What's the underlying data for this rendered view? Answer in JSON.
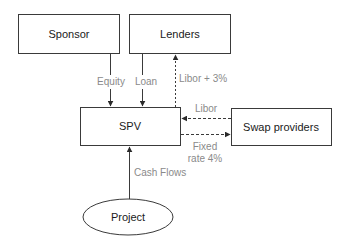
{
  "diagram": {
    "nodes": {
      "sponsor": {
        "label": "Sponsor",
        "shape": "rect"
      },
      "lenders": {
        "label": "Lenders",
        "shape": "rect"
      },
      "spv": {
        "label": "SPV",
        "shape": "rect"
      },
      "swap": {
        "label": "Swap providers",
        "shape": "rect"
      },
      "project": {
        "label": "Project",
        "shape": "ellipse"
      }
    },
    "edges": {
      "equity": {
        "from": "Sponsor",
        "to": "SPV",
        "label": "Equity",
        "style": "solid"
      },
      "loan": {
        "from": "Lenders",
        "to": "SPV",
        "label": "Loan",
        "style": "solid"
      },
      "libor_plus": {
        "from": "SPV",
        "to": "Lenders",
        "label": "Libor + 3%",
        "style": "dashed"
      },
      "libor": {
        "from": "Swap providers",
        "to": "SPV",
        "label": "Libor",
        "style": "dashed"
      },
      "fixed": {
        "from": "SPV",
        "to": "Swap providers",
        "label_line1": "Fixed",
        "label_line2": "rate 4%",
        "style": "dashed"
      },
      "cashflows": {
        "from": "Project",
        "to": "SPV",
        "label": "Cash Flows",
        "style": "solid"
      }
    },
    "colors": {
      "stroke": "#3a3a3a",
      "label": "#8a8a8a",
      "text": "#1a1a1a"
    }
  }
}
